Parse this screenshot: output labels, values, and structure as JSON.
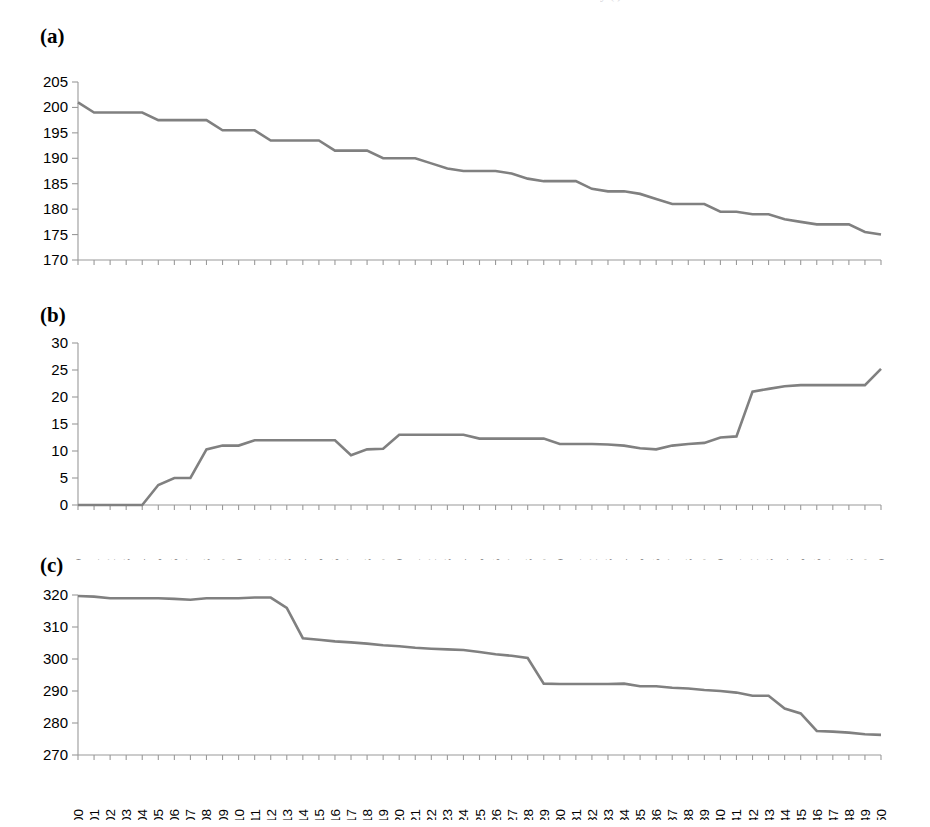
{
  "figure": {
    "background": "#ffffff",
    "line_color": "#808080",
    "axis_color": "#9a9a9a",
    "clipped_header_fragment": "y                                  (    )"
  },
  "panels": [
    {
      "id": "a",
      "label": "(a)"
    },
    {
      "id": "b",
      "label": "(b)"
    },
    {
      "id": "c",
      "label": "(c)"
    }
  ],
  "chart_data": [
    {
      "type": "line",
      "panel": "(a)",
      "title": "",
      "xlabel": "",
      "ylabel": "",
      "xlim": [
        300,
        350
      ],
      "ylim": [
        170,
        205
      ],
      "yticks": [
        170,
        175,
        180,
        185,
        190,
        195,
        200,
        205
      ],
      "grid": false,
      "legend": null,
      "x": [
        300,
        301,
        302,
        303,
        304,
        305,
        306,
        307,
        308,
        309,
        310,
        311,
        312,
        313,
        314,
        315,
        316,
        317,
        318,
        319,
        320,
        321,
        322,
        323,
        324,
        325,
        326,
        327,
        328,
        329,
        330,
        331,
        332,
        333,
        334,
        335,
        336,
        337,
        338,
        339,
        340,
        341,
        342,
        343,
        344,
        345,
        346,
        347,
        348,
        349,
        350
      ],
      "categories": [
        "300",
        "301",
        "302",
        "303",
        "304",
        "305",
        "306",
        "307",
        "308",
        "309",
        "310",
        "311",
        "312",
        "313",
        "314",
        "315",
        "316",
        "317",
        "318",
        "319",
        "320",
        "321",
        "322",
        "323",
        "324",
        "325",
        "326",
        "327",
        "328",
        "329",
        "330",
        "331",
        "332",
        "333",
        "334",
        "335",
        "336",
        "337",
        "338",
        "339",
        "340",
        "341",
        "342",
        "343",
        "344",
        "345",
        "346",
        "347",
        "348",
        "349",
        "350"
      ],
      "values": [
        201,
        199,
        199,
        199,
        199,
        197.5,
        197.5,
        197.5,
        197.5,
        195.5,
        195.5,
        195.5,
        193.5,
        193.5,
        193.5,
        193.5,
        191.5,
        191.5,
        191.5,
        190,
        190,
        190,
        189,
        188,
        187.5,
        187.5,
        187.5,
        187,
        186,
        185.5,
        185.5,
        185.5,
        184,
        183.5,
        183.5,
        183,
        182,
        181,
        181,
        181,
        179.5,
        179.5,
        179,
        179,
        178,
        177.5,
        177,
        177,
        177,
        175.5,
        175
      ]
    },
    {
      "type": "line",
      "panel": "(b)",
      "title": "",
      "xlabel": "",
      "ylabel": "",
      "xlim": [
        300,
        350
      ],
      "ylim": [
        0,
        30
      ],
      "yticks": [
        0,
        5,
        10,
        15,
        20,
        25,
        30
      ],
      "grid": false,
      "legend": null,
      "x": [
        300,
        301,
        302,
        303,
        304,
        305,
        306,
        307,
        308,
        309,
        310,
        311,
        312,
        313,
        314,
        315,
        316,
        317,
        318,
        319,
        320,
        321,
        322,
        323,
        324,
        325,
        326,
        327,
        328,
        329,
        330,
        331,
        332,
        333,
        334,
        335,
        336,
        337,
        338,
        339,
        340,
        341,
        342,
        343,
        344,
        345,
        346,
        347,
        348,
        349,
        350
      ],
      "categories": [
        "300",
        "301",
        "302",
        "303",
        "304",
        "305",
        "306",
        "307",
        "308",
        "309",
        "310",
        "311",
        "312",
        "313",
        "314",
        "315",
        "316",
        "317",
        "318",
        "319",
        "320",
        "321",
        "322",
        "323",
        "324",
        "325",
        "326",
        "327",
        "328",
        "329",
        "330",
        "331",
        "332",
        "333",
        "334",
        "335",
        "336",
        "337",
        "338",
        "339",
        "340",
        "341",
        "342",
        "343",
        "344",
        "345",
        "346",
        "347",
        "348",
        "349",
        "350"
      ],
      "values": [
        0,
        0,
        0,
        0,
        0,
        3.7,
        5,
        5,
        10.3,
        11,
        11,
        12,
        12,
        12,
        12,
        12,
        12,
        9.2,
        10.3,
        10.4,
        13,
        13,
        13,
        13,
        13,
        12.3,
        12.3,
        12.3,
        12.3,
        12.3,
        11.3,
        11.3,
        11.3,
        11.2,
        11,
        10.5,
        10.3,
        11,
        11.3,
        11.5,
        12.5,
        12.7,
        21,
        21.5,
        22,
        22.2,
        22.2,
        22.2,
        22.2,
        22.2,
        25.2
      ]
    },
    {
      "type": "line",
      "panel": "(c)",
      "title": "",
      "xlabel": "",
      "ylabel": "",
      "xlim": [
        300,
        350
      ],
      "ylim": [
        270,
        320
      ],
      "yticks": [
        270,
        280,
        290,
        300,
        310,
        320
      ],
      "grid": false,
      "legend": null,
      "x": [
        300,
        301,
        302,
        303,
        304,
        305,
        306,
        307,
        308,
        309,
        310,
        311,
        312,
        313,
        314,
        315,
        316,
        317,
        318,
        319,
        320,
        321,
        322,
        323,
        324,
        325,
        326,
        327,
        328,
        329,
        330,
        331,
        332,
        333,
        334,
        335,
        336,
        337,
        338,
        339,
        340,
        341,
        342,
        343,
        344,
        345,
        346,
        347,
        348,
        349,
        350
      ],
      "categories": [
        "300",
        "301",
        "302",
        "303",
        "304",
        "305",
        "306",
        "307",
        "308",
        "309",
        "310",
        "311",
        "312",
        "313",
        "314",
        "315",
        "316",
        "317",
        "318",
        "319",
        "320",
        "321",
        "322",
        "323",
        "324",
        "325",
        "326",
        "327",
        "328",
        "329",
        "330",
        "331",
        "332",
        "333",
        "334",
        "335",
        "336",
        "337",
        "338",
        "339",
        "340",
        "341",
        "342",
        "343",
        "344",
        "345",
        "346",
        "347",
        "348",
        "349",
        "350"
      ],
      "values": [
        319.7,
        319.5,
        319,
        319,
        319,
        319,
        318.8,
        318.5,
        319,
        319,
        319,
        319.2,
        319.2,
        316,
        306.5,
        306,
        305.5,
        305.2,
        304.8,
        304.3,
        304,
        303.5,
        303.2,
        303,
        302.8,
        302.2,
        301.5,
        301,
        300.3,
        292.3,
        292.2,
        292.2,
        292.2,
        292.2,
        292.3,
        291.5,
        291.5,
        291,
        290.8,
        290.3,
        290,
        289.5,
        288.5,
        288.5,
        284.5,
        283,
        277.5,
        277.3,
        277,
        276.5,
        276.3
      ]
    }
  ]
}
